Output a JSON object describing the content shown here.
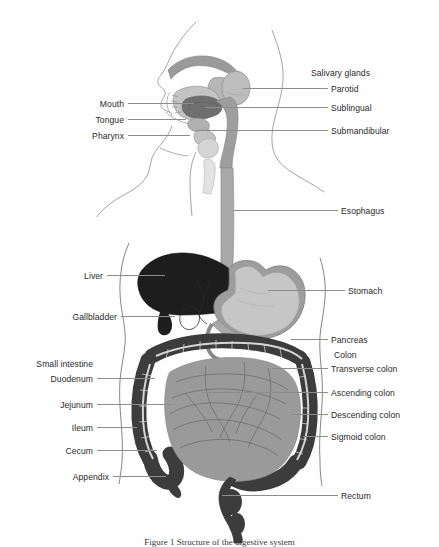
{
  "figure": {
    "title": "Structure of the digestive system",
    "caption": "Figure 1    Structure of the digestive system",
    "style": "grayscale line and tone illustration"
  },
  "labels": {
    "right": [
      {
        "key": "salivary_glands",
        "text": "Salivary glands",
        "x": 311,
        "y": 69,
        "leader": false
      },
      {
        "key": "parotid",
        "text": "Parotid",
        "x": 331,
        "y": 85,
        "leader": true,
        "lx": 243,
        "lw": 85,
        "ly": 88
      },
      {
        "key": "sublingual",
        "text": "Sublingual",
        "x": 331,
        "y": 104,
        "leader": true,
        "lx": 205,
        "lw": 123,
        "ly": 107
      },
      {
        "key": "submandibular",
        "text": "Submandibular",
        "x": 331,
        "y": 127,
        "leader": true,
        "lx": 196,
        "lw": 132,
        "ly": 130
      },
      {
        "key": "esophagus",
        "text": "Esophagus",
        "x": 341,
        "y": 207,
        "leader": true,
        "lx": 233,
        "lw": 105,
        "ly": 210
      },
      {
        "key": "stomach",
        "text": "Stomach",
        "x": 348,
        "y": 287,
        "leader": true,
        "lx": 268,
        "lw": 77,
        "ly": 290
      },
      {
        "key": "pancreas",
        "text": "Pancreas",
        "x": 331,
        "y": 336,
        "leader": true,
        "lx": 291,
        "lw": 37,
        "ly": 339
      },
      {
        "key": "colon",
        "text": "Colon",
        "x": 334,
        "y": 351,
        "leader": false
      },
      {
        "key": "transverse_colon",
        "text": "Transverse colon",
        "x": 331,
        "y": 365,
        "leader": true,
        "lx": 272,
        "lw": 56,
        "ly": 368
      },
      {
        "key": "ascending_colon",
        "text": "Ascending colon",
        "x": 331,
        "y": 389,
        "leader": true,
        "lx": 202,
        "lw": 126,
        "ly": 392
      },
      {
        "key": "descending_colon",
        "text": "Descending colon",
        "x": 331,
        "y": 411,
        "leader": true,
        "lx": 291,
        "lw": 37,
        "ly": 414
      },
      {
        "key": "sigmoid_colon",
        "text": "Sigmoid colon",
        "x": 331,
        "y": 433,
        "leader": true,
        "lx": 303,
        "lw": 25,
        "ly": 436
      },
      {
        "key": "rectum",
        "text": "Rectum",
        "x": 341,
        "y": 492,
        "leader": true,
        "lx": 222,
        "lw": 116,
        "ly": 495
      }
    ],
    "left": [
      {
        "key": "mouth",
        "text": "Mouth",
        "x": 124,
        "y": 100,
        "leader": true,
        "lx": 128,
        "lw": 66,
        "ly": 103
      },
      {
        "key": "tongue",
        "text": "Tongue",
        "x": 124,
        "y": 116,
        "leader": true,
        "lx": 128,
        "lw": 58,
        "ly": 119
      },
      {
        "key": "pharynx",
        "text": "Pharynx",
        "x": 124,
        "y": 132,
        "leader": true,
        "lx": 128,
        "lw": 62,
        "ly": 135
      },
      {
        "key": "liver",
        "text": "Liver",
        "x": 103,
        "y": 272,
        "leader": true,
        "lx": 107,
        "lw": 58,
        "ly": 275
      },
      {
        "key": "gallbladder",
        "text": "Gallbladder",
        "x": 117,
        "y": 313,
        "leader": true,
        "lx": 121,
        "lw": 54,
        "ly": 316
      },
      {
        "key": "small_intestine",
        "text": "Small intestine",
        "x": 93,
        "y": 360,
        "leader": false
      },
      {
        "key": "duodenum",
        "text": "Duodenum",
        "x": 93,
        "y": 375,
        "leader": true,
        "lx": 97,
        "lw": 58,
        "ly": 378
      },
      {
        "key": "jejunum",
        "text": "Jejunum",
        "x": 93,
        "y": 401,
        "leader": true,
        "lx": 97,
        "lw": 74,
        "ly": 404
      },
      {
        "key": "ileum",
        "text": "Ileum",
        "x": 93,
        "y": 424,
        "leader": true,
        "lx": 97,
        "lw": 40,
        "ly": 427
      },
      {
        "key": "cecum",
        "text": "Cecum",
        "x": 93,
        "y": 447,
        "leader": true,
        "lx": 97,
        "lw": 60,
        "ly": 450
      },
      {
        "key": "appendix",
        "text": "Appendix",
        "x": 109,
        "y": 473,
        "leader": true,
        "lx": 113,
        "lw": 53,
        "ly": 476
      }
    ]
  },
  "colors": {
    "background": "#fefefe",
    "outline": "#8d8d8d",
    "leader": "#8d8d8d",
    "text": "#2b2b2b",
    "liver": "#1d1d1d",
    "colon": "#3c3c3c",
    "small_intestine": "#9a9a9a",
    "stomach_lumen": "#c6c6c6",
    "stomach_wall": "#9d9d9d",
    "esophagus": "#a8a8a8",
    "tongue": "#6f6f6f",
    "palate": "#9a9a9a",
    "parotid": "#bdbdbd",
    "pharynx": "#cfcfcf"
  }
}
